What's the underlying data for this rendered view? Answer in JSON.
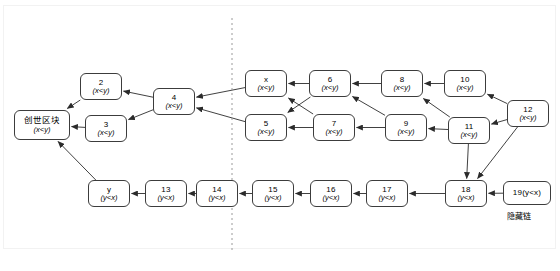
{
  "diagram": {
    "divider": {
      "name": "dashed-divider",
      "style": "dashed-vertical-line",
      "color": "#999999"
    },
    "caption": {
      "hidden_chain_label": "隐藏链"
    },
    "conditions": {
      "public": "(x<y)",
      "hidden": "(y<x)"
    },
    "nodes": [
      {
        "id": "genesis",
        "label": "创世区块",
        "cond": "(x<y)",
        "x": 14,
        "y": 110,
        "w": 56,
        "h": 30,
        "two_line": true,
        "cjk": true
      },
      {
        "id": "b2",
        "label": "2",
        "cond": "(x<y)",
        "x": 80,
        "y": 73,
        "w": 42,
        "h": 27,
        "two_line": true,
        "cjk": false
      },
      {
        "id": "b3",
        "label": "3",
        "cond": "(x<y)",
        "x": 85,
        "y": 115,
        "w": 42,
        "h": 27,
        "two_line": true,
        "cjk": false
      },
      {
        "id": "b4",
        "label": "4",
        "cond": "(x<y)",
        "x": 153,
        "y": 88,
        "w": 42,
        "h": 27,
        "two_line": true,
        "cjk": false
      },
      {
        "id": "bx",
        "label": "x",
        "cond": "(x<y)",
        "x": 245,
        "y": 70,
        "w": 42,
        "h": 27,
        "two_line": true,
        "cjk": false
      },
      {
        "id": "b5",
        "label": "5",
        "cond": "(x<y)",
        "x": 245,
        "y": 114,
        "w": 42,
        "h": 27,
        "two_line": true,
        "cjk": false
      },
      {
        "id": "b6",
        "label": "6",
        "cond": "(x<y)",
        "x": 309,
        "y": 70,
        "w": 42,
        "h": 27,
        "two_line": true,
        "cjk": false
      },
      {
        "id": "b7",
        "label": "7",
        "cond": "(x<y)",
        "x": 313,
        "y": 114,
        "w": 42,
        "h": 27,
        "two_line": true,
        "cjk": false
      },
      {
        "id": "b8",
        "label": "8",
        "cond": "(x<y)",
        "x": 381,
        "y": 70,
        "w": 42,
        "h": 27,
        "two_line": true,
        "cjk": false
      },
      {
        "id": "b9",
        "label": "9",
        "cond": "(x<y)",
        "x": 385,
        "y": 114,
        "w": 42,
        "h": 27,
        "two_line": true,
        "cjk": false
      },
      {
        "id": "b10",
        "label": "10",
        "cond": "(x<y)",
        "x": 444,
        "y": 70,
        "w": 42,
        "h": 27,
        "two_line": true,
        "cjk": false
      },
      {
        "id": "b11",
        "label": "11",
        "cond": "(x<y)",
        "x": 448,
        "y": 117,
        "w": 42,
        "h": 27,
        "two_line": true,
        "cjk": false
      },
      {
        "id": "b12",
        "label": "12",
        "cond": "(x<y)",
        "x": 507,
        "y": 100,
        "w": 42,
        "h": 27,
        "two_line": true,
        "cjk": false
      },
      {
        "id": "by",
        "label": "y",
        "cond": "(y<x)",
        "x": 88,
        "y": 180,
        "w": 42,
        "h": 27,
        "two_line": true,
        "cjk": false
      },
      {
        "id": "b13",
        "label": "13",
        "cond": "(y<x)",
        "x": 145,
        "y": 180,
        "w": 42,
        "h": 27,
        "two_line": true,
        "cjk": false
      },
      {
        "id": "b14",
        "label": "14",
        "cond": "(y<x)",
        "x": 196,
        "y": 180,
        "w": 42,
        "h": 27,
        "two_line": true,
        "cjk": false
      },
      {
        "id": "b15",
        "label": "15",
        "cond": "(y<x)",
        "x": 252,
        "y": 180,
        "w": 42,
        "h": 27,
        "two_line": true,
        "cjk": false
      },
      {
        "id": "b16",
        "label": "16",
        "cond": "(y<x)",
        "x": 310,
        "y": 180,
        "w": 42,
        "h": 27,
        "two_line": true,
        "cjk": false
      },
      {
        "id": "b17",
        "label": "17",
        "cond": "(y<x)",
        "x": 366,
        "y": 180,
        "w": 42,
        "h": 27,
        "two_line": true,
        "cjk": false
      },
      {
        "id": "b18",
        "label": "18",
        "cond": "(y<x)",
        "x": 445,
        "y": 180,
        "w": 42,
        "h": 27,
        "two_line": true,
        "cjk": false
      },
      {
        "id": "b19",
        "label": "19(y<x)",
        "cond": "",
        "x": 503,
        "y": 181,
        "w": 48,
        "h": 24,
        "two_line": false,
        "cjk": false
      }
    ],
    "edges": [
      {
        "from": "b2",
        "to": "genesis"
      },
      {
        "from": "b3",
        "to": "genesis"
      },
      {
        "from": "by",
        "to": "genesis"
      },
      {
        "from": "b4",
        "to": "b2"
      },
      {
        "from": "b4",
        "to": "b3"
      },
      {
        "from": "bx",
        "to": "b4"
      },
      {
        "from": "b5",
        "to": "b4"
      },
      {
        "from": "b6",
        "to": "bx"
      },
      {
        "from": "b6",
        "to": "b5"
      },
      {
        "from": "b7",
        "to": "bx"
      },
      {
        "from": "b7",
        "to": "b5"
      },
      {
        "from": "b8",
        "to": "b6"
      },
      {
        "from": "b9",
        "to": "b6"
      },
      {
        "from": "b9",
        "to": "b7"
      },
      {
        "from": "b10",
        "to": "b8"
      },
      {
        "from": "b11",
        "to": "b8"
      },
      {
        "from": "b11",
        "to": "b9"
      },
      {
        "from": "b12",
        "to": "b10"
      },
      {
        "from": "b12",
        "to": "b11"
      },
      {
        "from": "b13",
        "to": "by"
      },
      {
        "from": "b14",
        "to": "b13"
      },
      {
        "from": "b15",
        "to": "b14"
      },
      {
        "from": "b16",
        "to": "b15"
      },
      {
        "from": "b17",
        "to": "b16"
      },
      {
        "from": "b18",
        "to": "b17"
      },
      {
        "from": "b19",
        "to": "b18"
      },
      {
        "from": "b11",
        "to": "b18"
      },
      {
        "from": "b12",
        "to": "b18"
      }
    ]
  }
}
